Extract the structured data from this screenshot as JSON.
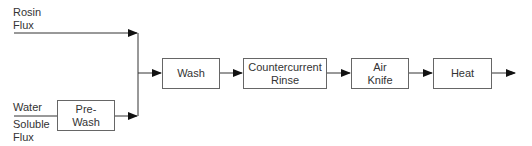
{
  "inputs": {
    "rosin_flux": "Rosin\nFlux",
    "water_soluble_top": "Water",
    "water_soluble_bottom": "Soluble\nFlux"
  },
  "steps": {
    "pre_wash": "Pre-\nWash",
    "wash": "Wash",
    "countercurrent_rinse": "Countercurrent\nRinse",
    "air_knife": "Air\nKnife",
    "heat": "Heat"
  }
}
